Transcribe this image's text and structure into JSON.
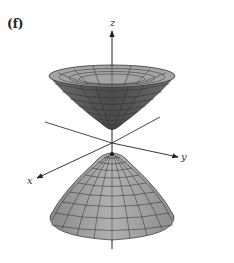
{
  "figure": {
    "panel_label": "(f)",
    "surface": "hyperboloid of two sheets",
    "axes": {
      "x_label": "x",
      "y_label": "y",
      "z_label": "z"
    },
    "colors": {
      "surface_fill": "#9a9a9a",
      "surface_fill_light": "#b4b4b4",
      "surface_dark": "#5a5a5a",
      "mesh": "#2a2a2a",
      "axis": "#222222",
      "background": "#ffffff"
    }
  }
}
